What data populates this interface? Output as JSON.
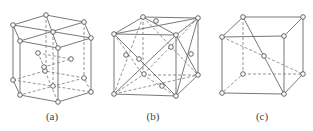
{
  "figure": {
    "panels": [
      {
        "id": "a",
        "label": "(a)",
        "structure": "hexagonal close-packed unit cell"
      },
      {
        "id": "b",
        "label": "(b)",
        "structure": "face-centered cubic unit cell"
      },
      {
        "id": "c",
        "label": "(c)",
        "structure": "body-centered cubic unit cell"
      }
    ]
  },
  "colors": {
    "line": "#6a6a6a",
    "atom_fill": "#ffffff",
    "atom_stroke": "#555555",
    "background": "#ffffff"
  }
}
